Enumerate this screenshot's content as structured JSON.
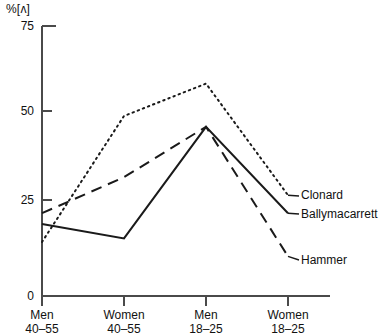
{
  "chart_data": {
    "type": "line",
    "title": "",
    "ylabel": "%[ʌ]",
    "xlabel": "",
    "ylim": [
      0,
      75
    ],
    "yticks": [
      0,
      25,
      50,
      75
    ],
    "grid": false,
    "legend_position": "right-inline",
    "categories": [
      {
        "line1": "Men",
        "line2": "40–55"
      },
      {
        "line1": "Women",
        "line2": "40–55"
      },
      {
        "line1": "Men",
        "line2": "18–25"
      },
      {
        "line1": "Women",
        "line2": "18–25"
      }
    ],
    "series": [
      {
        "name": "Clonard",
        "style": "dotted",
        "color": "#1a1a1a",
        "values": [
          15,
          50,
          59,
          28
        ]
      },
      {
        "name": "Ballymacarrett",
        "style": "solid",
        "color": "#1a1a1a",
        "values": [
          20,
          16,
          47,
          23
        ]
      },
      {
        "name": "Hammer",
        "style": "dashed",
        "color": "#1a1a1a",
        "values": [
          23,
          33,
          47,
          11
        ]
      }
    ]
  },
  "axis": {
    "color": "#4a4a4a",
    "tick_labels": [
      "75",
      "50",
      "25",
      "0"
    ]
  }
}
